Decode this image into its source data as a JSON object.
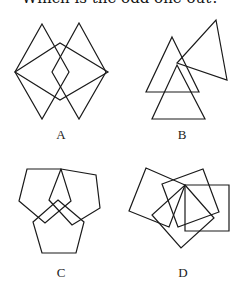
{
  "question": {
    "title": "Which is the odd one out?"
  },
  "options": [
    {
      "label": "A",
      "description": "two tall diamonds and one wide diamond overlapping",
      "shape": "diamond",
      "count": 3
    },
    {
      "label": "B",
      "description": "three overlapping triangles",
      "shape": "triangle",
      "count": 3
    },
    {
      "label": "C",
      "description": "three overlapping pentagons",
      "shape": "pentagon",
      "count": 3
    },
    {
      "label": "D",
      "description": "four overlapping squares",
      "shape": "square",
      "count": 4
    }
  ],
  "style": {
    "stroke_color": "#1a1a1a",
    "background": "#ffffff"
  }
}
